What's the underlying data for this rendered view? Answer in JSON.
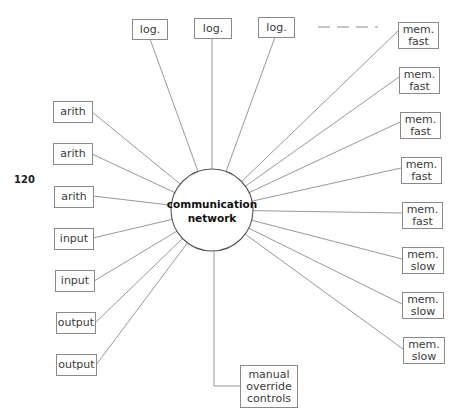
{
  "page_number": "120",
  "hub": {
    "label_lines": [
      "communication",
      "network"
    ],
    "cx": 212,
    "cy": 210,
    "r": 41
  },
  "continuation": {
    "x1": 318,
    "y1": 27,
    "x2": 378,
    "y2": 27
  },
  "nodes": [
    {
      "id": "log-1",
      "lines": [
        "log."
      ],
      "x": 132,
      "y": 19,
      "w": 35,
      "h": 20,
      "ax": 150,
      "ay": 39
    },
    {
      "id": "log-2",
      "lines": [
        "log."
      ],
      "x": 194,
      "y": 18,
      "w": 37,
      "h": 20,
      "ax": 212,
      "ay": 38
    },
    {
      "id": "log-3",
      "lines": [
        "log."
      ],
      "x": 258,
      "y": 17,
      "w": 36,
      "h": 20,
      "ax": 275,
      "ay": 37
    },
    {
      "id": "mem-fast-1",
      "lines": [
        "mem.",
        "fast"
      ],
      "x": 398,
      "y": 22,
      "w": 40,
      "h": 26,
      "ax": 398,
      "ay": 31
    },
    {
      "id": "mem-fast-2",
      "lines": [
        "mem.",
        "fast"
      ],
      "x": 399,
      "y": 67,
      "w": 40,
      "h": 26,
      "ax": 399,
      "ay": 77
    },
    {
      "id": "mem-fast-3",
      "lines": [
        "mem.",
        "fast"
      ],
      "x": 400,
      "y": 112,
      "w": 40,
      "h": 26,
      "ax": 400,
      "ay": 122
    },
    {
      "id": "mem-fast-4",
      "lines": [
        "mem.",
        "fast"
      ],
      "x": 401,
      "y": 157,
      "w": 40,
      "h": 26,
      "ax": 401,
      "ay": 168
    },
    {
      "id": "mem-fast-5",
      "lines": [
        "mem.",
        "fast"
      ],
      "x": 402,
      "y": 202,
      "w": 40,
      "h": 26,
      "ax": 402,
      "ay": 213
    },
    {
      "id": "mem-slow-1",
      "lines": [
        "mem.",
        "slow"
      ],
      "x": 402,
      "y": 247,
      "w": 41,
      "h": 26,
      "ax": 402,
      "ay": 259
    },
    {
      "id": "mem-slow-2",
      "lines": [
        "mem.",
        "slow"
      ],
      "x": 402,
      "y": 292,
      "w": 41,
      "h": 26,
      "ax": 402,
      "ay": 304
    },
    {
      "id": "mem-slow-3",
      "lines": [
        "mem.",
        "slow"
      ],
      "x": 403,
      "y": 337,
      "w": 41,
      "h": 26,
      "ax": 403,
      "ay": 349
    },
    {
      "id": "arith-1",
      "lines": [
        "arith"
      ],
      "x": 53,
      "y": 101,
      "w": 39,
      "h": 21,
      "ax": 92,
      "ay": 112
    },
    {
      "id": "arith-2",
      "lines": [
        "arith"
      ],
      "x": 53,
      "y": 143,
      "w": 39,
      "h": 21,
      "ax": 92,
      "ay": 154
    },
    {
      "id": "arith-3",
      "lines": [
        "arith"
      ],
      "x": 54,
      "y": 186,
      "w": 39,
      "h": 21,
      "ax": 93,
      "ay": 196
    },
    {
      "id": "input-1",
      "lines": [
        "input"
      ],
      "x": 54,
      "y": 228,
      "w": 39,
      "h": 21,
      "ax": 93,
      "ay": 238
    },
    {
      "id": "input-2",
      "lines": [
        "input"
      ],
      "x": 55,
      "y": 270,
      "w": 39,
      "h": 21,
      "ax": 94,
      "ay": 281
    },
    {
      "id": "output-1",
      "lines": [
        "output"
      ],
      "x": 56,
      "y": 312,
      "w": 39,
      "h": 21,
      "ax": 95,
      "ay": 323
    },
    {
      "id": "output-2",
      "lines": [
        "output"
      ],
      "x": 56,
      "y": 354,
      "w": 40,
      "h": 21,
      "ax": 96,
      "ay": 365
    },
    {
      "id": "manual-override-controls",
      "lines": [
        "manual",
        "override",
        "controls"
      ],
      "x": 240,
      "y": 365,
      "w": 57,
      "h": 42,
      "ax": 240,
      "ay": 386,
      "elbow": true
    }
  ]
}
